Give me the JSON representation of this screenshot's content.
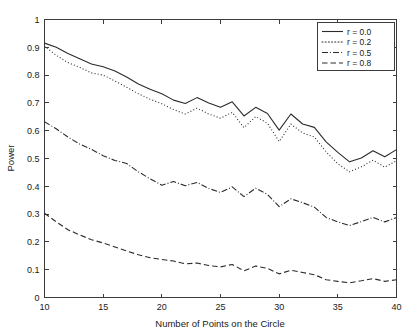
{
  "chart_data": {
    "type": "line",
    "title": "",
    "xlabel": "Number of Points on the Circle",
    "ylabel": "Power",
    "xlim": [
      10,
      40
    ],
    "ylim": [
      0,
      1
    ],
    "xticks": [
      10,
      15,
      20,
      25,
      30,
      35,
      40
    ],
    "xticklabels": [
      "10",
      "15",
      "20",
      "25",
      "30",
      "35",
      "40"
    ],
    "yticks": [
      0,
      0.1,
      0.2,
      0.3,
      0.4,
      0.5,
      0.6,
      0.7,
      0.8,
      0.9,
      1
    ],
    "yticklabels": [
      "0",
      "0.1",
      "0.2",
      "0.3",
      "0.4",
      "0.5",
      "0.6",
      "0.7",
      "0.8",
      "0.9",
      "1"
    ],
    "grid": false,
    "legend_position": "upper right",
    "x": [
      10,
      11,
      12,
      13,
      14,
      15,
      16,
      17,
      18,
      19,
      20,
      21,
      22,
      23,
      24,
      25,
      26,
      27,
      28,
      29,
      30,
      31,
      32,
      33,
      34,
      35,
      36,
      37,
      38,
      39,
      40
    ],
    "series": [
      {
        "name": "r = 0.0",
        "linestyle": "solid",
        "dash": "none",
        "color": "#2b2b2b",
        "values": [
          0.915,
          0.9,
          0.878,
          0.859,
          0.84,
          0.83,
          0.815,
          0.793,
          0.768,
          0.749,
          0.733,
          0.71,
          0.698,
          0.719,
          0.7,
          0.684,
          0.704,
          0.653,
          0.684,
          0.662,
          0.602,
          0.66,
          0.624,
          0.612,
          0.56,
          0.522,
          0.488,
          0.502,
          0.528,
          0.506,
          0.532
        ]
      },
      {
        "name": "r = 0.2",
        "linestyle": "dotted",
        "dash": "1,2.2",
        "color": "#4a4a4a",
        "values": [
          0.905,
          0.871,
          0.845,
          0.828,
          0.808,
          0.8,
          0.779,
          0.756,
          0.733,
          0.713,
          0.697,
          0.676,
          0.66,
          0.681,
          0.66,
          0.645,
          0.666,
          0.611,
          0.651,
          0.627,
          0.561,
          0.624,
          0.592,
          0.577,
          0.524,
          0.481,
          0.452,
          0.47,
          0.494,
          0.469,
          0.492
        ]
      },
      {
        "name": "r = 0.5",
        "linestyle": "dashdot",
        "dash": "6,2,1,2",
        "color": "#2b2b2b",
        "values": [
          0.632,
          0.607,
          0.577,
          0.552,
          0.533,
          0.51,
          0.493,
          0.482,
          0.452,
          0.427,
          0.404,
          0.417,
          0.402,
          0.414,
          0.392,
          0.378,
          0.398,
          0.363,
          0.393,
          0.371,
          0.327,
          0.355,
          0.341,
          0.325,
          0.288,
          0.272,
          0.259,
          0.273,
          0.288,
          0.272,
          0.288
        ]
      },
      {
        "name": "r = 0.8",
        "linestyle": "dashed",
        "dash": "5.5,3",
        "color": "#2b2b2b",
        "values": [
          0.303,
          0.272,
          0.244,
          0.225,
          0.208,
          0.196,
          0.182,
          0.167,
          0.154,
          0.143,
          0.137,
          0.131,
          0.121,
          0.124,
          0.115,
          0.11,
          0.119,
          0.096,
          0.113,
          0.105,
          0.085,
          0.098,
          0.09,
          0.082,
          0.064,
          0.058,
          0.053,
          0.06,
          0.068,
          0.058,
          0.064
        ]
      }
    ]
  },
  "legend": {
    "entries": [
      {
        "label": "r = 0.0"
      },
      {
        "label": "r = 0.2"
      },
      {
        "label": "r = 0.5"
      },
      {
        "label": "r = 0.8"
      }
    ]
  }
}
